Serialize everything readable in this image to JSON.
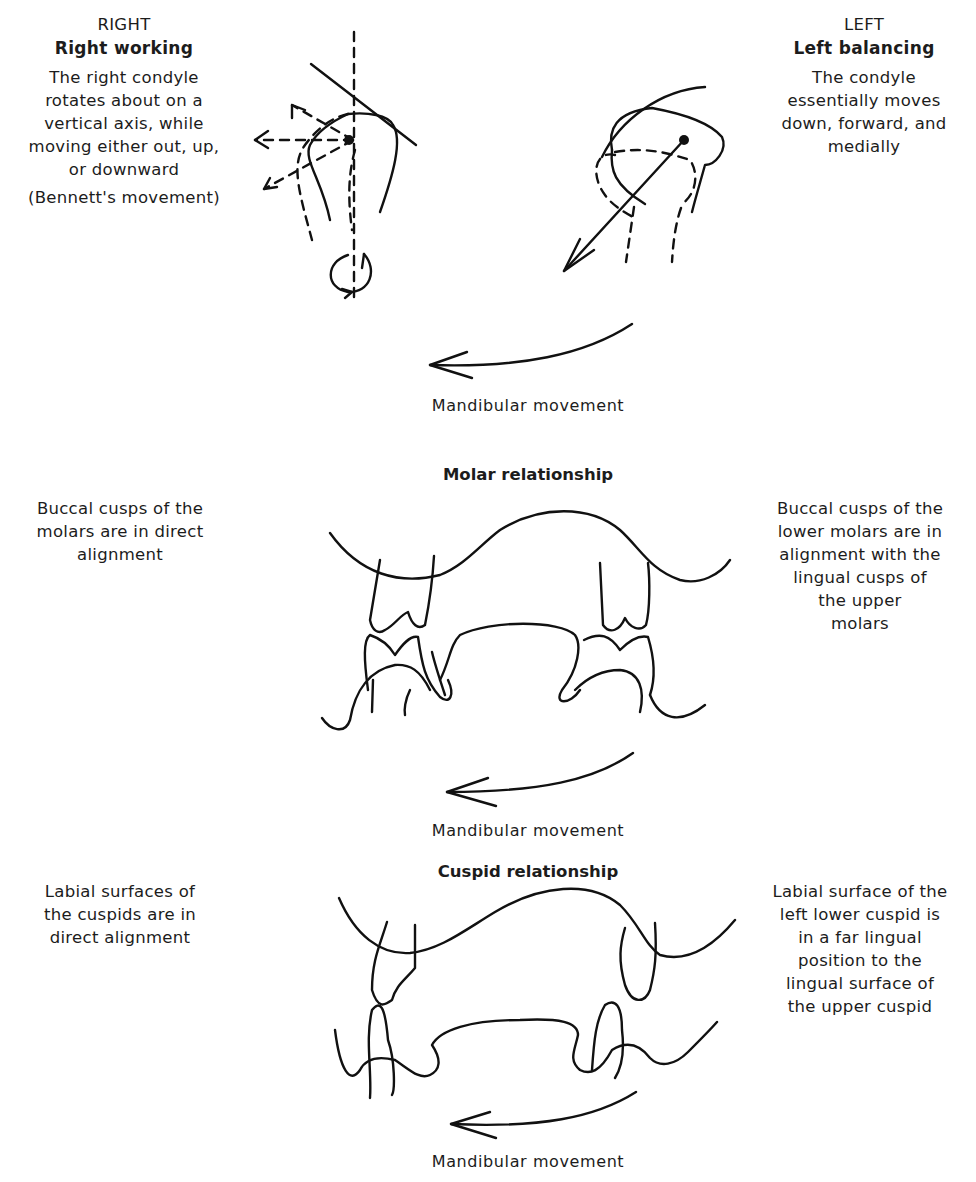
{
  "diagram": {
    "type": "labeled-illustration",
    "topic": "Mandibular lateral movement: condyle, molar and cuspid relationships",
    "condyles": {
      "right": {
        "side_label": "RIGHT",
        "title": "Right working",
        "description_lines": [
          "The right condyle",
          "rotates about on a",
          "vertical axis, while",
          "moving either out, up,",
          "or downward"
        ],
        "note": "(Bennett's movement)"
      },
      "left": {
        "side_label": "LEFT",
        "title": "Left balancing",
        "description_lines": [
          "The condyle",
          "essentially moves",
          "down, forward, and",
          "medially"
        ]
      },
      "arrow_caption": "Mandibular movement"
    },
    "molar_section": {
      "heading": "Molar relationship",
      "left_text_lines": [
        "Buccal cusps of the",
        "molars are in direct",
        "alignment"
      ],
      "right_text_lines": [
        "Buccal cusps of the",
        "lower molars are in",
        "alignment with the",
        "lingual cusps of",
        "the upper",
        "molars"
      ],
      "arrow_caption": "Mandibular movement"
    },
    "cuspid_section": {
      "heading": "Cuspid relationship",
      "left_text_lines": [
        "Labial surfaces of",
        "the cuspids are in",
        "direct alignment"
      ],
      "right_text_lines": [
        "Labial surface of the",
        "left lower cuspid is",
        "in a far lingual",
        "position to the",
        "lingual surface of",
        "the upper cuspid"
      ],
      "arrow_caption": "Mandibular movement"
    }
  }
}
